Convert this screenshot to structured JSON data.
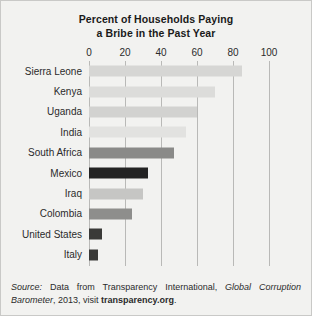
{
  "figure": {
    "background_color": "#f2f2f0",
    "border_color": "#c9c9c7"
  },
  "title": {
    "line1": "Percent of Households Paying",
    "line2": "a Bribe in the Past Year"
  },
  "source": {
    "lead": "Source:",
    "text_before_work": " Data from Transparency International, ",
    "work": "Global Corruption Barometer",
    "text_after_work": ", 2013, visit ",
    "site": "transparency.org",
    "end": "."
  },
  "chart_data": {
    "type": "bar",
    "orientation": "horizontal",
    "title": "Percent of Households Paying a Bribe in the Past Year",
    "xlabel": "",
    "ylabel": "",
    "xlim": [
      0,
      100
    ],
    "xticks": [
      0,
      20,
      40,
      60,
      80,
      100
    ],
    "xtick_labels": [
      "0",
      "20",
      "40",
      "60",
      "80",
      "100"
    ],
    "grid": true,
    "grid_axis": "x",
    "legend": false,
    "categories": [
      "Sierra Leone",
      "Kenya",
      "Uganda",
      "India",
      "South Africa",
      "Mexico",
      "Iraq",
      "Colombia",
      "United States",
      "Italy"
    ],
    "values": [
      85,
      70,
      60,
      54,
      47,
      33,
      30,
      24,
      7,
      5
    ],
    "bar_colors": [
      "#d6d6d4",
      "#dcdcda",
      "#d2d2d0",
      "#e2e2e0",
      "#8a8a88",
      "#232323",
      "#c6c6c4",
      "#8e8e8c",
      "#3a3a38",
      "#3a3a38"
    ]
  }
}
